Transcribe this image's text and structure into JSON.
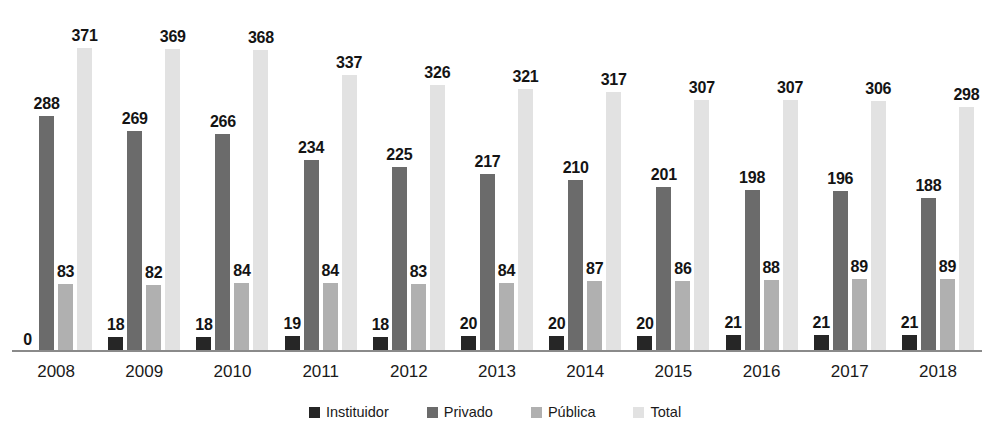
{
  "chart_data": {
    "type": "bar",
    "title": "",
    "subtitle": "",
    "xlabel": "",
    "ylabel": "",
    "categories": [
      "2008",
      "2009",
      "2010",
      "2011",
      "2012",
      "2013",
      "2014",
      "2015",
      "2016",
      "2017",
      "2018"
    ],
    "series": [
      {
        "name": "Instituidor",
        "color": "#262626",
        "values": [
          0,
          18,
          18,
          19,
          18,
          20,
          20,
          20,
          21,
          21,
          21
        ]
      },
      {
        "name": "Privado",
        "color": "#6b6b6b",
        "values": [
          288,
          269,
          266,
          234,
          225,
          217,
          210,
          201,
          198,
          196,
          188
        ]
      },
      {
        "name": "Pública",
        "color": "#b0b0b0",
        "values": [
          83,
          82,
          84,
          84,
          83,
          84,
          87,
          86,
          88,
          89,
          89
        ]
      },
      {
        "name": "Total",
        "color": "#e2e2e2",
        "values": [
          371,
          369,
          368,
          337,
          326,
          321,
          317,
          307,
          307,
          306,
          298
        ]
      }
    ],
    "ylim": [
      0,
      390
    ],
    "grid": false,
    "legend_position": "bottom",
    "data_labels": true,
    "axis_color": "#8a8a8a"
  }
}
